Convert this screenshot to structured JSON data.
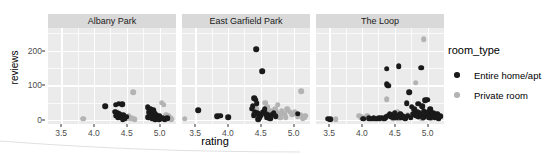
{
  "chart_data": {
    "type": "scatter",
    "title": "",
    "xlabel": "rating",
    "ylabel": "reviews",
    "xlim": [
      3.3,
      5.25
    ],
    "ylim": [
      -12,
      265
    ],
    "grid": true,
    "facet_variable": "neighbourhood",
    "legend_position": "right",
    "x_ticks": [
      3.5,
      4.0,
      4.5,
      5.0
    ],
    "x_tick_labels": [
      "3.5",
      "4.0",
      "4.5",
      "5.0"
    ],
    "y_ticks": [
      0,
      100,
      200
    ],
    "y_tick_labels": [
      "0",
      "100",
      "200"
    ],
    "legend": {
      "title": "room_type",
      "entries": [
        {
          "name": "Entire home/apt",
          "color": "#1a1a1a"
        },
        {
          "name": "Private room",
          "color": "#b3b3b3"
        }
      ]
    },
    "facets": [
      {
        "label": "Albany Park",
        "series": [
          {
            "name": "Entire home/apt",
            "color": "#1a1a1a",
            "points": [
              [
                4.17,
                40
              ],
              [
                4.33,
                44
              ],
              [
                4.38,
                46
              ],
              [
                4.43,
                45
              ],
              [
                4.32,
                24
              ],
              [
                4.36,
                20
              ],
              [
                4.39,
                17
              ],
              [
                4.34,
                12
              ],
              [
                4.37,
                8
              ],
              [
                4.41,
                10
              ],
              [
                4.45,
                14
              ],
              [
                4.42,
                6
              ],
              [
                4.47,
                4
              ],
              [
                4.5,
                9
              ],
              [
                4.44,
                2
              ],
              [
                4.82,
                36
              ],
              [
                4.86,
                32
              ],
              [
                4.9,
                28
              ],
              [
                4.84,
                22
              ],
              [
                4.88,
                18
              ],
              [
                4.92,
                20
              ],
              [
                4.87,
                12
              ],
              [
                4.91,
                9
              ],
              [
                4.95,
                14
              ],
              [
                4.83,
                7
              ],
              [
                4.89,
                4
              ],
              [
                4.93,
                2
              ],
              [
                4.97,
                6
              ],
              [
                5.0,
                10
              ],
              [
                5.02,
                3
              ],
              [
                5.05,
                5
              ],
              [
                4.99,
                1
              ],
              [
                5.08,
                2
              ],
              [
                5.12,
                4
              ]
            ]
          },
          {
            "name": "Private room",
            "color": "#b3b3b3",
            "points": [
              [
                3.84,
                3
              ],
              [
                4.6,
                79
              ],
              [
                4.53,
                10
              ],
              [
                4.57,
                4
              ],
              [
                4.49,
                3
              ],
              [
                4.62,
                2
              ],
              [
                5.03,
                50
              ],
              [
                5.06,
                44
              ],
              [
                5.1,
                14
              ],
              [
                5.14,
                10
              ],
              [
                5.16,
                6
              ],
              [
                5.09,
                3
              ],
              [
                4.94,
                5
              ],
              [
                5.18,
                2
              ]
            ]
          }
        ]
      },
      {
        "label": "East Garfield Park",
        "series": [
          {
            "name": "Entire home/apt",
            "color": "#1a1a1a",
            "points": [
              [
                4.43,
                203
              ],
              [
                4.52,
                141
              ],
              [
                4.4,
                62
              ],
              [
                4.42,
                58
              ],
              [
                4.44,
                48
              ],
              [
                4.38,
                40
              ],
              [
                4.36,
                32
              ],
              [
                4.41,
                24
              ],
              [
                4.45,
                20
              ],
              [
                4.39,
                14
              ],
              [
                4.47,
                18
              ],
              [
                4.5,
                12
              ],
              [
                4.54,
                22
              ],
              [
                4.58,
                16
              ],
              [
                4.56,
                30
              ],
              [
                4.62,
                8
              ],
              [
                4.66,
                14
              ],
              [
                4.7,
                20
              ],
              [
                4.73,
                10
              ],
              [
                4.6,
                6
              ],
              [
                4.48,
                6
              ],
              [
                3.55,
                27
              ],
              [
                3.84,
                10
              ],
              [
                3.88,
                12
              ],
              [
                4.0,
                8
              ],
              [
                4.46,
                2
              ],
              [
                4.64,
                3
              ],
              [
                5.06,
                18
              ]
            ]
          },
          {
            "name": "Private room",
            "color": "#b3b3b3",
            "points": [
              [
                3.34,
                3
              ],
              [
                4.42,
                40
              ],
              [
                4.44,
                30
              ],
              [
                4.4,
                20
              ],
              [
                4.46,
                12
              ],
              [
                4.57,
                50
              ],
              [
                4.6,
                38
              ],
              [
                4.55,
                16
              ],
              [
                4.64,
                26
              ],
              [
                4.68,
                20
              ],
              [
                4.72,
                30
              ],
              [
                4.76,
                44
              ],
              [
                4.74,
                22
              ],
              [
                4.78,
                16
              ],
              [
                4.82,
                26
              ],
              [
                4.86,
                18
              ],
              [
                4.9,
                30
              ],
              [
                4.94,
                24
              ],
              [
                4.98,
                16
              ],
              [
                5.02,
                22
              ],
              [
                5.12,
                82
              ],
              [
                5.06,
                10
              ],
              [
                5.1,
                14
              ],
              [
                5.16,
                8
              ],
              [
                5.18,
                12
              ],
              [
                4.88,
                8
              ],
              [
                4.8,
                6
              ],
              [
                5.14,
                4
              ]
            ]
          }
        ]
      },
      {
        "label": "The Loop",
        "series": [
          {
            "name": "Entire home/apt",
            "color": "#1a1a1a",
            "points": [
              [
                4.38,
                148
              ],
              [
                4.56,
                155
              ],
              [
                4.9,
                151
              ],
              [
                4.38,
                103
              ],
              [
                4.4,
                98
              ],
              [
                4.72,
                80
              ],
              [
                4.68,
                48
              ],
              [
                4.76,
                38
              ],
              [
                4.86,
                46
              ],
              [
                4.92,
                40
              ],
              [
                4.96,
                57
              ],
              [
                4.99,
                58
              ],
              [
                5.04,
                30
              ],
              [
                4.8,
                30
              ],
              [
                4.84,
                24
              ],
              [
                4.88,
                20
              ],
              [
                4.94,
                26
              ],
              [
                4.97,
                18
              ],
              [
                5.01,
                22
              ],
              [
                5.06,
                16
              ],
              [
                5.09,
                20
              ],
              [
                5.12,
                14
              ],
              [
                5.15,
                18
              ],
              [
                4.78,
                16
              ],
              [
                4.82,
                12
              ],
              [
                4.86,
                10
              ],
              [
                4.9,
                14
              ],
              [
                4.93,
                8
              ],
              [
                4.98,
                12
              ],
              [
                5.02,
                8
              ],
              [
                5.05,
                6
              ],
              [
                5.08,
                10
              ],
              [
                5.11,
                6
              ],
              [
                5.14,
                8
              ],
              [
                5.17,
                5
              ],
              [
                5.19,
                10
              ],
              [
                4.42,
                18
              ],
              [
                4.46,
                14
              ],
              [
                4.5,
                20
              ],
              [
                4.54,
                12
              ],
              [
                4.58,
                16
              ],
              [
                4.62,
                10
              ],
              [
                4.48,
                8
              ],
              [
                4.52,
                6
              ],
              [
                4.44,
                10
              ],
              [
                4.4,
                12
              ],
              [
                4.36,
                8
              ],
              [
                4.6,
                6
              ],
              [
                4.64,
                8
              ],
              [
                4.66,
                4
              ],
              [
                4.7,
                12
              ],
              [
                4.74,
                6
              ],
              [
                3.48,
                3
              ],
              [
                3.52,
                2
              ],
              [
                4.02,
                3
              ],
              [
                4.1,
                4
              ],
              [
                4.14,
                3
              ],
              [
                4.18,
                5
              ],
              [
                4.22,
                3
              ],
              [
                4.26,
                4
              ],
              [
                4.3,
                6
              ],
              [
                4.34,
                3
              ]
            ]
          },
          {
            "name": "Private room",
            "color": "#b3b3b3",
            "points": [
              [
                4.94,
                232
              ],
              [
                4.4,
                100
              ],
              [
                4.82,
                107
              ],
              [
                4.38,
                60
              ],
              [
                4.54,
                22
              ],
              [
                4.58,
                18
              ],
              [
                4.5,
                14
              ],
              [
                4.62,
                12
              ],
              [
                4.44,
                10
              ],
              [
                4.66,
                8
              ],
              [
                4.7,
                14
              ],
              [
                3.6,
                2
              ],
              [
                3.96,
                12
              ],
              [
                3.99,
                8
              ],
              [
                4.04,
                6
              ],
              [
                4.08,
                10
              ],
              [
                4.12,
                4
              ],
              [
                4.2,
                3
              ],
              [
                4.24,
                5
              ],
              [
                4.28,
                3
              ],
              [
                4.32,
                4
              ],
              [
                4.46,
                6
              ],
              [
                4.56,
                5
              ],
              [
                4.48,
                3
              ],
              [
                5.0,
                9
              ],
              [
                5.05,
                5
              ],
              [
                5.1,
                7
              ],
              [
                5.16,
                4
              ],
              [
                4.88,
                6
              ],
              [
                4.92,
                4
              ]
            ]
          }
        ]
      }
    ]
  }
}
